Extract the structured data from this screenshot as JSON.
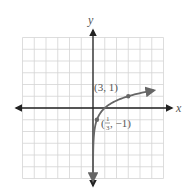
{
  "chart_data": {
    "type": "line",
    "title": "",
    "xlabel": "x",
    "ylabel": "y",
    "xlim": [
      -6,
      6
    ],
    "ylim": [
      -6,
      6
    ],
    "grid": true,
    "function": "y = log_3(x)",
    "series": [
      {
        "name": "y = log3(x)",
        "points": [
          [
            0.0014,
            -6
          ],
          [
            0.0123,
            -4
          ],
          [
            0.111,
            -2
          ],
          [
            0.333,
            -1
          ],
          [
            1,
            0
          ],
          [
            3,
            1
          ],
          [
            5,
            1.465
          ],
          [
            5.2,
            1.5
          ]
        ]
      }
    ],
    "annotations": [
      {
        "text": "(3, 1)",
        "x": 3,
        "y": 1
      },
      {
        "text": "(1/3, −1)",
        "x": 0.3333,
        "y": -1
      }
    ]
  },
  "labels": {
    "x_axis": "x",
    "y_axis": "y",
    "point1": "(3, 1)",
    "point2_open": "(",
    "point2_num": "1",
    "point2_den": "3",
    "point2_rest": ", −1)"
  }
}
